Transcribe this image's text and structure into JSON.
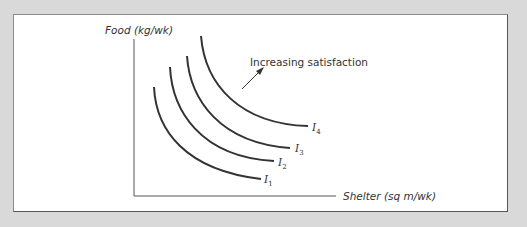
{
  "diagram": {
    "y_axis_label": "Food (kg/wk)",
    "x_axis_label": "Shelter (sq m/wk)",
    "annotation": "Increasing satisfaction",
    "curves": [
      {
        "name": "I",
        "sub": "1"
      },
      {
        "name": "I",
        "sub": "2"
      },
      {
        "name": "I",
        "sub": "3"
      },
      {
        "name": "I",
        "sub": "4"
      }
    ],
    "colors": {
      "background": "#d9d9d9",
      "panel": "#ffffff",
      "line": "#333333"
    }
  }
}
